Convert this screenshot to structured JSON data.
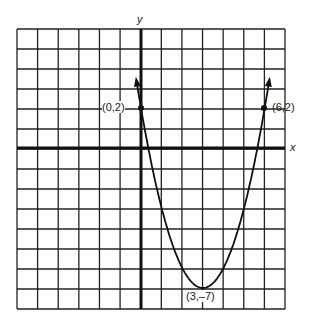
{
  "chart_data": {
    "type": "line",
    "title": "",
    "xlabel": "x",
    "ylabel": "y",
    "xlim": [
      -6,
      7
    ],
    "ylim": [
      -8,
      6
    ],
    "grid": true,
    "function": "y = x^2 - 6x + 2 (parabola, vertex (3,-7))",
    "points_labeled": [
      {
        "x": 0,
        "y": 2,
        "label": "(0,2)"
      },
      {
        "x": 6,
        "y": 2,
        "label": "(6,2)"
      },
      {
        "x": 3,
        "y": -7,
        "label": "(3,–7)"
      }
    ],
    "arrows": "both ends continue upward"
  },
  "labels": {
    "x_axis": "x",
    "y_axis": "y",
    "p1": "(0,2)",
    "p2": "(6,2)",
    "vertex": "(3,–7)"
  }
}
